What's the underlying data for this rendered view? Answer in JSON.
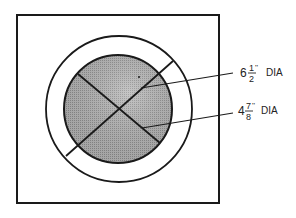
{
  "diagram": {
    "title": "",
    "outer_circle": {
      "label_whole": "6",
      "label_num": "1",
      "label_den": "2",
      "label_unit": "''",
      "label_suffix": "DIA"
    },
    "inner_circle": {
      "label_whole": "4",
      "label_num": "7",
      "label_den": "8",
      "label_unit": "''",
      "label_suffix": "DIA"
    },
    "colors": {
      "stroke": "#1a1a1a",
      "inner_fill": "#a8a8a8",
      "background": "#ffffff"
    }
  }
}
